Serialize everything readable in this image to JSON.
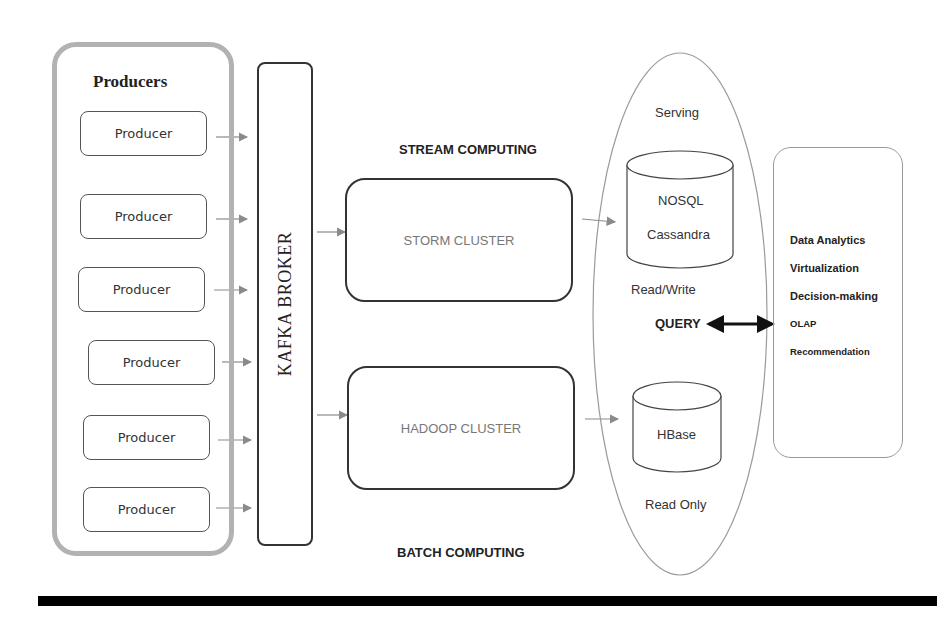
{
  "producers": {
    "title": "Producers",
    "items": [
      {
        "label": "Producer"
      },
      {
        "label": "Producer"
      },
      {
        "label": "Producer"
      },
      {
        "label": "Producer"
      },
      {
        "label": "Producer"
      },
      {
        "label": "Producer"
      }
    ]
  },
  "broker": {
    "label": "KAFKA BROKER"
  },
  "stream": {
    "section_label": "STREAM COMPUTING",
    "cluster_label": "STORM CLUSTER"
  },
  "batch": {
    "section_label": "BATCH COMPUTING",
    "cluster_label": "HADOOP CLUSTER"
  },
  "serving": {
    "title": "Serving",
    "nosql": {
      "line1": "NOSQL",
      "line2": "Cassandra",
      "access": "Read/Write"
    },
    "query_label": "QUERY",
    "hbase": {
      "label": "HBase",
      "access": "Read Only"
    }
  },
  "applications": {
    "items": [
      {
        "label": "Data Analytics"
      },
      {
        "label": "Virtualization"
      },
      {
        "label": "Decision-making"
      },
      {
        "label": "OLAP"
      },
      {
        "label": "Recommendation"
      }
    ]
  },
  "colors": {
    "group_border": "#b2b2b2",
    "box_border": "#333333",
    "arrow": "#888888",
    "cluster_text": "#777777",
    "bar": "#000000"
  }
}
